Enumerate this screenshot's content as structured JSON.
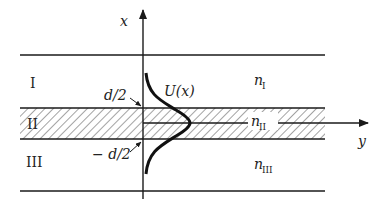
{
  "diagram": {
    "axes": {
      "vertical_label": "x",
      "horizontal_label": "y"
    },
    "regions": [
      {
        "id": "I",
        "label": "I",
        "index_label": "n",
        "index_sub": "I"
      },
      {
        "id": "II",
        "label": "II",
        "index_label": "n",
        "index_sub": "II",
        "hatched": true
      },
      {
        "id": "III",
        "label": "III",
        "index_label": "n",
        "index_sub": "III"
      }
    ],
    "boundaries": {
      "upper": "d/2",
      "lower": "− d/2"
    },
    "mode_profile_label": "U(x)",
    "colors": {
      "line": "#1a1a1a",
      "hatch": "#333333",
      "background": "#ffffff"
    }
  }
}
